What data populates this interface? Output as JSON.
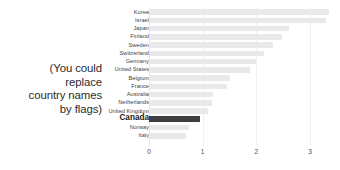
{
  "annotation": {
    "lines": [
      "(You could",
      "replace",
      "country names",
      "by flags)"
    ]
  },
  "chart_data": {
    "type": "bar",
    "orientation": "horizontal",
    "title": "",
    "xlabel": "",
    "ylabel": "",
    "xlim": [
      0,
      3.45
    ],
    "xticks": [
      0,
      1,
      2,
      3
    ],
    "xticklabels": [
      "0",
      "1",
      "2",
      "3"
    ],
    "grid": true,
    "grid_axis": "x",
    "legend": null,
    "highlight_category": "Canada",
    "colors": {
      "bar": "#e9e9e9",
      "highlight_bar": "#3f3f3f",
      "gridline": "#efefef",
      "label": "#3d3d3d",
      "highlight_label": "#1a1a1a",
      "tick": "#4a4a4a",
      "background": "#ffffff",
      "annotation_text": "#2b2b2b"
    },
    "categories": [
      "Korea",
      "Israel",
      "Japan",
      "Finland",
      "Sweden",
      "Switzerland",
      "Germany",
      "United States",
      "Belgium",
      "France",
      "Australia",
      "Netherlands",
      "United Kingdom",
      "Canada",
      "Norway",
      "Italy"
    ],
    "values": [
      3.35,
      3.3,
      2.6,
      2.48,
      2.3,
      2.15,
      2.0,
      1.88,
      1.5,
      1.45,
      1.2,
      1.17,
      1.1,
      0.95,
      0.75,
      0.68
    ]
  }
}
